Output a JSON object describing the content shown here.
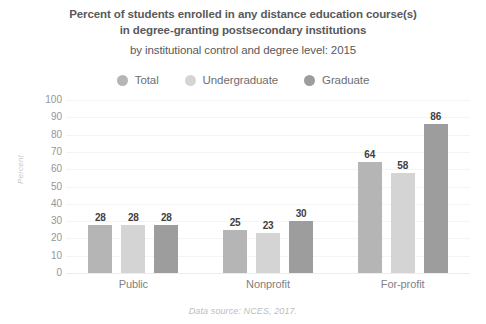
{
  "title": {
    "line1": "Percent of students enrolled in any distance education course(s)",
    "line2": "in degree-granting postsecondary institutions",
    "line3": "by institutional control and degree level: 2015"
  },
  "footer": {
    "source": "Data source: NCES, 2017."
  },
  "colors": {
    "total": "#b5b5b5",
    "undergraduate": "#d4d4d4",
    "graduate": "#9d9d9d",
    "title_text": "#58595b",
    "legend_text": "#6d6e71",
    "tick_text": "#939598",
    "value_text": "#414042",
    "gridline": "#f4f4f4",
    "background": "#ffffff"
  },
  "chart_data": {
    "type": "bar",
    "title": "Percent of students enrolled in any distance education course(s) in degree-granting postsecondary institutions by institutional control and degree level: 2015",
    "xlabel": "",
    "ylabel": "Percent",
    "ylim": [
      0,
      100
    ],
    "ytick_step": 10,
    "yticks": [
      100,
      90,
      80,
      70,
      60,
      50,
      40,
      30,
      20,
      10,
      0
    ],
    "ytick_labels": [
      "100",
      "90",
      "80",
      "70",
      "60",
      "50",
      "40",
      "30",
      "20",
      "10",
      "0"
    ],
    "categories": [
      "Public",
      "Nonprofit",
      "For-profit"
    ],
    "grid": true,
    "grid_axis": "y",
    "legend_position": "top",
    "series": [
      {
        "name": "Total",
        "color": "#b5b5b5",
        "values": [
          28,
          25,
          64
        ],
        "labels": [
          "28",
          "25",
          "64"
        ]
      },
      {
        "name": "Undergraduate",
        "color": "#d4d4d4",
        "values": [
          28,
          23,
          58
        ],
        "labels": [
          "28",
          "23",
          "58"
        ]
      },
      {
        "name": "Graduate",
        "color": "#9d9d9d",
        "values": [
          28,
          30,
          86
        ],
        "labels": [
          "28",
          "30",
          "86"
        ]
      }
    ],
    "annotations": [
      "Data source: NCES, 2017."
    ]
  }
}
